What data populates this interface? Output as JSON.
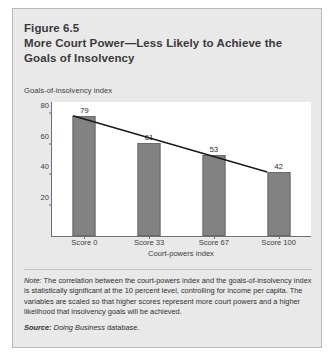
{
  "figure": {
    "number": "Figure 6.5",
    "title_line1": "More Court Power—Less Likely to Achieve the",
    "title_line2": "Goals of Insolvency"
  },
  "note": {
    "label": "Note:",
    "text": " The correlation between the court-powers index and the goals-of-insolvency index is statistically significant at the 10 percent level, controlling for income per capita. The variables are scaled so that higher scores represent more court powers and a higher likelihood that insolvency goals will be achieved."
  },
  "source": {
    "label": "Source:",
    "publication": " Doing Business",
    "suffix": " database."
  },
  "colors": {
    "panel_background": "#e9e9e9",
    "panel_border": "#b9b9b9",
    "plot_background": "#ffffff",
    "axis": "#6f6f6f",
    "bar_fill": "#828282",
    "bar_stroke": "#6a6a6a",
    "trendline": "#1a1a1a",
    "title_text": "#3a3a3a",
    "body_text": "#303030"
  },
  "chart_data": {
    "type": "bar",
    "title": "More Court Power—Less Likely to Achieve the Goals of Insolvency",
    "subtitle": "Figure 6.5",
    "categories": [
      "Score 0",
      "Score 33",
      "Score 67",
      "Score 100"
    ],
    "values": [
      79,
      61,
      53,
      42
    ],
    "data_labels": [
      "79",
      "61",
      "53",
      "42"
    ],
    "xlabel": "Court-powers index",
    "ylabel": "Goals-of-insolvency index",
    "ylim": [
      0,
      88
    ],
    "yticks": [
      20,
      40,
      60,
      80
    ],
    "ytick_labels": [
      "20",
      "40",
      "60",
      "80"
    ],
    "grid": false,
    "legend": "none",
    "series": [
      {
        "name": "Goals-of-insolvency index",
        "type": "bar",
        "values": [
          79,
          61,
          53,
          42
        ]
      },
      {
        "name": "trendline",
        "type": "line",
        "values": [
          79,
          66,
          54,
          42
        ]
      }
    ]
  }
}
